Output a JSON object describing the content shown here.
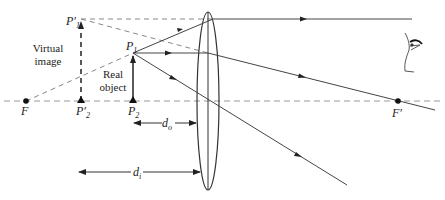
{
  "diagram": {
    "type": "thin-lens-ray-diagram",
    "colors": {
      "line": "#333333",
      "dashed": "#888888",
      "background": "#ffffff"
    },
    "labels": {
      "focal_left": "F",
      "focal_right": "F′",
      "object_top": "P",
      "object_top_sub": "1",
      "object_base": "P",
      "object_base_sub": "2",
      "image_top": "P′",
      "image_top_sub": "1",
      "image_base": "P′",
      "image_base_sub": "2",
      "virtual_image_line1": "Virtual",
      "virtual_image_line2": "image",
      "real_object_line1": "Real",
      "real_object_line2": "object",
      "object_distance": "d",
      "object_distance_sub": "o",
      "image_distance": "d",
      "image_distance_sub": "i"
    },
    "icons": {
      "eye": "eye-icon"
    }
  }
}
